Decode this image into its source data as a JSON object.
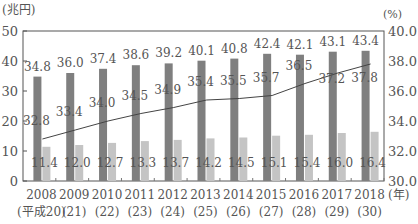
{
  "chart_data": {
    "type": "bar+line",
    "title": "",
    "left_unit": "(兆円)",
    "right_unit": "(%)",
    "x_suffix": "(年)",
    "categories": [
      "2008",
      "2009",
      "2010",
      "2011",
      "2012",
      "2013",
      "2014",
      "2015",
      "2016",
      "2017",
      "2018"
    ],
    "category_sublabels": [
      "(平成20)",
      "(21)",
      "(22)",
      "(23)",
      "(24)",
      "(25)",
      "(26)",
      "(27)",
      "(28)",
      "(29)",
      "(30)"
    ],
    "left_axis": {
      "ticks": [
        0,
        10,
        20,
        30,
        40,
        50
      ],
      "ylim": [
        0,
        50
      ]
    },
    "right_axis": {
      "ticks": [
        "30.0",
        "32.0",
        "34.0",
        "36.0",
        "38.0",
        "40.0"
      ],
      "ylim": [
        30,
        40
      ]
    },
    "series": [
      {
        "name": "dark bars (兆円)",
        "type": "bar",
        "axis": "left",
        "color": "#7f7f7f",
        "values": [
          34.8,
          36.0,
          37.4,
          38.6,
          39.2,
          40.1,
          40.8,
          42.4,
          42.1,
          43.1,
          43.4
        ]
      },
      {
        "name": "light bars (兆円)",
        "type": "bar",
        "axis": "left",
        "color": "#c4c4c4",
        "values": [
          11.4,
          12.0,
          12.7,
          13.3,
          13.7,
          14.2,
          14.5,
          15.1,
          15.4,
          16.0,
          16.4
        ]
      },
      {
        "name": "line (%)",
        "type": "line",
        "axis": "right",
        "color": "#444444",
        "values": [
          32.8,
          33.4,
          34.0,
          34.5,
          34.9,
          35.4,
          35.5,
          35.7,
          36.5,
          37.2,
          37.8
        ]
      }
    ],
    "grid": false,
    "legend": "none"
  }
}
